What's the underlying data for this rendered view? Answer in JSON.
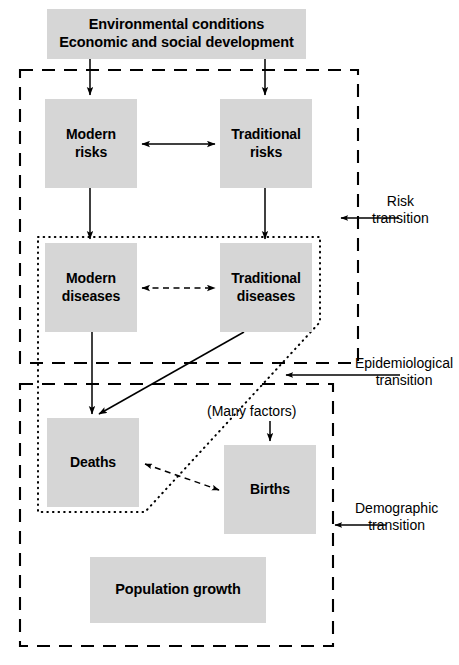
{
  "diagram": {
    "background_color": "#ffffff",
    "node_fill_color": "#d6d6d6",
    "line_color": "#000000",
    "nodes": [
      {
        "id": "environment",
        "line1": "Environmental conditions",
        "line2": "Economic and social development"
      },
      {
        "id": "modern-risks",
        "line1": "Modern",
        "line2": "risks"
      },
      {
        "id": "traditional-risks",
        "line1": "Traditional",
        "line2": "risks"
      },
      {
        "id": "modern-diseases",
        "line1": "Modern",
        "line2": "diseases"
      },
      {
        "id": "traditional-diseases",
        "line1": "Traditional",
        "line2": "diseases"
      },
      {
        "id": "deaths",
        "line1": "Deaths",
        "line2": ""
      },
      {
        "id": "births",
        "line1": "Births",
        "line2": ""
      },
      {
        "id": "population-growth",
        "line1": "Population growth",
        "line2": ""
      }
    ],
    "annotations": {
      "many_factors": "(Many factors)"
    },
    "side_labels": [
      {
        "id": "risk-transition",
        "line1": "Risk",
        "line2": "transition"
      },
      {
        "id": "epidemiological-transition",
        "line1": "Epidemiological",
        "line2": "transition"
      },
      {
        "id": "demographic-transition",
        "line1": "Demographic",
        "line2": "transition"
      }
    ],
    "boundaries": [
      {
        "id": "risk-transition-boundary",
        "style": "dashed"
      },
      {
        "id": "epidemiological-transition-boundary",
        "style": "dotted"
      },
      {
        "id": "demographic-transition-boundary",
        "style": "dashed"
      }
    ]
  }
}
